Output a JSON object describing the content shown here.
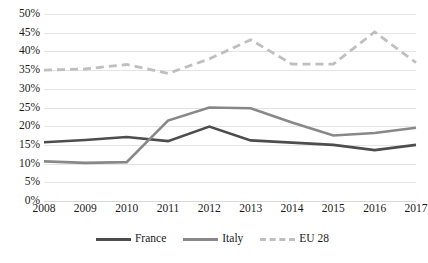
{
  "chart_data": {
    "type": "line",
    "title": "",
    "subtitle": "",
    "xlabel": "",
    "ylabel": "",
    "categories": [
      "2008",
      "2009",
      "2010",
      "2011",
      "2012",
      "2013",
      "2014",
      "2015",
      "2016",
      "2017"
    ],
    "x": [
      2008,
      2009,
      2010,
      2011,
      2012,
      2013,
      2014,
      2015,
      2016,
      2017
    ],
    "ylim": [
      0,
      50
    ],
    "ytick_step": 5,
    "ytick_labels": [
      "0%",
      "5%",
      "10%",
      "15%",
      "20%",
      "25%",
      "30%",
      "35%",
      "40%",
      "45%",
      "50%"
    ],
    "ytick_values": [
      0,
      5,
      10,
      15,
      20,
      25,
      30,
      35,
      40,
      45,
      50
    ],
    "grid": true,
    "grid_axis": "y",
    "legend_position": "bottom",
    "value_suffix": "%",
    "series": [
      {
        "name": "France",
        "color": "#4d4d4d",
        "style": "solid",
        "width": 2.6,
        "values": [
          15.7,
          16.3,
          17.1,
          16.0,
          19.9,
          16.2,
          15.6,
          15.0,
          13.6,
          15.0
        ]
      },
      {
        "name": "Italy",
        "color": "#888888",
        "style": "solid",
        "width": 2.6,
        "values": [
          10.6,
          10.2,
          10.4,
          21.5,
          25.0,
          24.8,
          21.0,
          17.5,
          18.2,
          19.6
        ]
      },
      {
        "name": "EU 28",
        "color": "#bfbfbf",
        "style": "dashed",
        "width": 2.8,
        "values": [
          35.0,
          35.3,
          36.5,
          34.1,
          38.0,
          43.1,
          36.6,
          36.6,
          45.2,
          37.0
        ]
      }
    ]
  },
  "legend": {
    "items": [
      {
        "label": "France",
        "color": "#4d4d4d",
        "style": "solid"
      },
      {
        "label": "Italy",
        "color": "#888888",
        "style": "solid"
      },
      {
        "label": "EU 28",
        "color": "#bfbfbf",
        "style": "dashed"
      }
    ]
  }
}
